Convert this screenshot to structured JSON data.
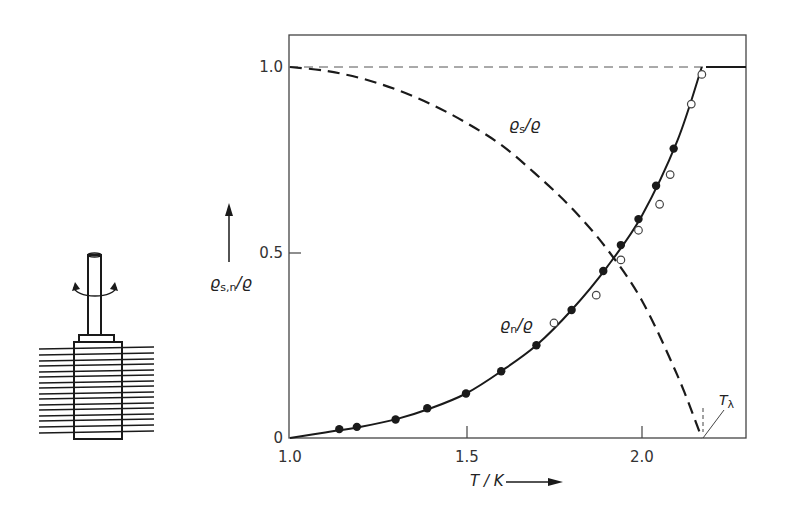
{
  "chart_data": {
    "type": "scatter",
    "title": "",
    "xlabel": "T / K",
    "ylabel": "ρs,n / ρ",
    "xlim": [
      1.0,
      2.3
    ],
    "ylim": [
      0,
      1.1
    ],
    "x_ticks": [
      1.0,
      1.5,
      2.0
    ],
    "x_tick_labels": [
      "1.0",
      "1.5",
      "2.0"
    ],
    "y_ticks": [
      0,
      0.5,
      1.0
    ],
    "y_tick_labels": [
      "0",
      "0.5",
      "1.0"
    ],
    "grid": false,
    "legend": null,
    "annotations": [
      {
        "text": "ρs/ρ",
        "near": [
          1.65,
          0.92
        ]
      },
      {
        "text": "ρn/ρ",
        "near": [
          1.72,
          0.32
        ]
      },
      {
        "text": "Tλ",
        "x": 2.17,
        "y": 0
      }
    ],
    "series": [
      {
        "name": "ρs/ρ (superfluid fraction, dashed curve)",
        "style": "dashed",
        "x": [
          1.0,
          1.1,
          1.2,
          1.3,
          1.4,
          1.5,
          1.6,
          1.7,
          1.8,
          1.9,
          2.0,
          2.1,
          2.17
        ],
        "values": [
          1.0,
          0.99,
          0.97,
          0.94,
          0.9,
          0.85,
          0.79,
          0.71,
          0.62,
          0.51,
          0.37,
          0.17,
          0.0
        ]
      },
      {
        "name": "ρn/ρ (normal fraction, solid fit curve)",
        "style": "solid",
        "x": [
          1.0,
          1.1,
          1.2,
          1.3,
          1.4,
          1.5,
          1.6,
          1.7,
          1.8,
          1.9,
          2.0,
          2.1,
          2.17,
          2.3
        ],
        "values": [
          0.0,
          0.015,
          0.03,
          0.05,
          0.08,
          0.12,
          0.18,
          0.25,
          0.345,
          0.46,
          0.6,
          0.8,
          1.0,
          1.0
        ]
      },
      {
        "name": "ρn/ρ measured (filled circles)",
        "marker": "filled-circle",
        "x": [
          1.14,
          1.19,
          1.3,
          1.39,
          1.5,
          1.6,
          1.7,
          1.8,
          1.89,
          1.94,
          1.99,
          2.04,
          2.09
        ],
        "values": [
          0.024,
          0.03,
          0.05,
          0.08,
          0.12,
          0.18,
          0.25,
          0.345,
          0.45,
          0.52,
          0.59,
          0.68,
          0.78
        ]
      },
      {
        "name": "ρn/ρ measured (open circles)",
        "marker": "open-circle",
        "x": [
          1.75,
          1.87,
          1.94,
          1.99,
          2.05,
          2.08,
          2.14,
          2.17
        ],
        "values": [
          0.31,
          0.385,
          0.48,
          0.56,
          0.63,
          0.71,
          0.9,
          0.98
        ]
      },
      {
        "name": "reference line ρ/ρ = 1",
        "style": "thin-dashed",
        "x": [
          1.0,
          2.17
        ],
        "values": [
          1.0,
          1.0
        ]
      }
    ],
    "lambda_point": {
      "label": "Tλ",
      "T": 2.17
    }
  },
  "labels": {
    "y_axis_main": "ϱ",
    "y_axis_sub": "s,n",
    "y_axis_tail": "/ϱ",
    "x_axis": "T / K",
    "rho_s_main": "ϱ",
    "rho_s_sub": "s",
    "rho_s_tail": "/ϱ",
    "rho_n_main": "ϱ",
    "rho_n_sub": "n",
    "rho_n_tail": "/ϱ",
    "t_lambda_main": "T",
    "t_lambda_sub": "λ",
    "x_tick_1": "1.0",
    "x_tick_2": "1.5",
    "x_tick_3": "2.0",
    "y_tick_0": "0",
    "y_tick_1": "0.5",
    "y_tick_2": "1.0"
  },
  "apparatus": {
    "description": "Andronikashvili torsion pendulum: stack of thin discs on a rotating rod immersed in liquid helium"
  },
  "colors": {
    "ink": "#1a1a1a",
    "axis": "#444444",
    "background": "#ffffff"
  }
}
